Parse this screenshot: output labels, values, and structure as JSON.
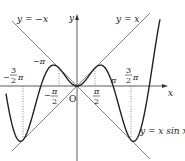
{
  "chart_data": {
    "type": "line",
    "title": "",
    "xlabel": "x",
    "ylabel": "y",
    "origin_label": "O",
    "series": [
      {
        "name": "y = x sin x",
        "label": "y = x sin x",
        "style": "solid-thick"
      },
      {
        "name": "y = x",
        "label": "y = x",
        "style": "solid-thin"
      },
      {
        "name": "y = -x",
        "label": "y = −x",
        "style": "solid-thin"
      }
    ],
    "x_ticks": [
      {
        "value": "-3π/2",
        "label_num": "3",
        "label_den": "2",
        "sign": "−",
        "suffix": "π"
      },
      {
        "value": "-π",
        "label": "−π"
      },
      {
        "value": "-π/2",
        "label_num": "π",
        "label_den": "2",
        "sign": "−"
      },
      {
        "value": "π/2",
        "label_num": "π",
        "label_den": "2"
      },
      {
        "value": "π",
        "label": "π"
      },
      {
        "value": "3π/2",
        "label_num": "3",
        "label_den": "2",
        "suffix": "π"
      }
    ],
    "key_points": [
      {
        "x": "-3π/2",
        "y": "-3π/2",
        "note": "tangent to y = x (local min)"
      },
      {
        "x": "-π",
        "y": 0
      },
      {
        "x": "-π/2",
        "y": "π/2",
        "note": "tangent to y = -x"
      },
      {
        "x": 0,
        "y": 0
      },
      {
        "x": "π/2",
        "y": "π/2",
        "note": "tangent to y = x"
      },
      {
        "x": "π",
        "y": 0
      },
      {
        "x": "3π/2",
        "y": "-3π/2",
        "note": "tangent to y = -x (local min)"
      }
    ],
    "guides": "dotted vertical lines at x = ±π/2 and x = ±3π/2",
    "grid": false,
    "legend": "inline labels"
  },
  "labels": {
    "neg_x_line": "y = −x",
    "pos_x_line": "y = x",
    "curve": "y = x sin x",
    "y_axis": "y",
    "x_axis": "x",
    "origin": "O",
    "neg_pi": "−π",
    "pos_pi": "π",
    "pi": "π",
    "two": "2",
    "three": "3",
    "minus": "−"
  }
}
